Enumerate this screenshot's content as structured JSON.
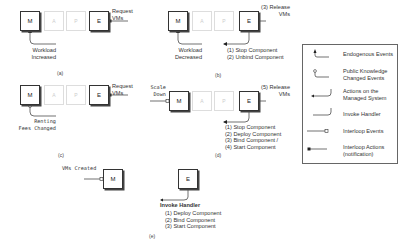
{
  "panels": {
    "a": {
      "caption": "(a)",
      "nodes": [
        "M",
        "A",
        "P",
        "E"
      ],
      "trigger": [
        "Workload",
        "Increased"
      ],
      "action": [
        "Request",
        "VMs"
      ]
    },
    "b": {
      "caption": "(b)",
      "nodes": [
        "M",
        "A",
        "P",
        "E"
      ],
      "trigger": [
        "Workload",
        "Decreased"
      ],
      "action": [
        "(3) Release",
        "VMs"
      ],
      "managed_actions": [
        "(1) Stop Component",
        "(2) Unbind Component"
      ]
    },
    "c": {
      "caption": "(c)",
      "nodes": [
        "M",
        "A",
        "P",
        "E"
      ],
      "trigger": [
        "Renting",
        "Fees Changed"
      ],
      "action": [
        "Request",
        "VMs"
      ]
    },
    "d": {
      "caption": "(d)",
      "nodes": [
        "M",
        "A",
        "P",
        "E"
      ],
      "interloop_event": [
        "Scale",
        "Down"
      ],
      "action": [
        "(5) Release",
        "VMs"
      ],
      "managed_actions": [
        "(1) Stop Component",
        "(2) Deploy Component",
        "(3) Bind Component /",
        "(4) Start Component"
      ]
    },
    "e": {
      "caption": "(e)",
      "nodes": [
        "M",
        "E"
      ],
      "interloop_event": "VMs Created",
      "handler_title": "Invoke Handler",
      "handler_steps": [
        "(1) Deploy Component",
        "(2) Bind Component",
        "(3) Start Component"
      ]
    }
  },
  "legend": {
    "items": [
      {
        "icon": "endogenous-event-icon",
        "label": [
          "Endogenous Events"
        ]
      },
      {
        "icon": "public-knowledge-event-icon",
        "label": [
          "Public Knowledge",
          "Changed Events"
        ]
      },
      {
        "icon": "managed-action-icon",
        "label": [
          "Actions on the",
          "Managed System"
        ]
      },
      {
        "icon": "invoke-handler-icon",
        "label": [
          "Invoke Handler"
        ]
      },
      {
        "icon": "interloop-event-icon",
        "label": [
          "Interloop Events"
        ]
      },
      {
        "icon": "interloop-action-icon",
        "label": [
          "Interloop Actions",
          "(notification)"
        ]
      }
    ]
  }
}
